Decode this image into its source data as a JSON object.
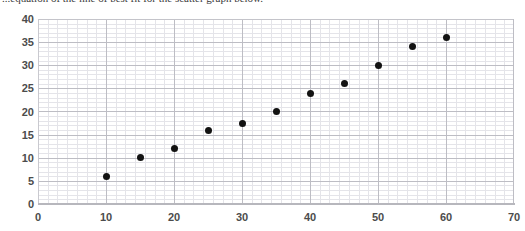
{
  "document": {
    "clipped_line": "...equation of the line of best fit for the scatter graph below."
  },
  "chart_data": {
    "type": "scatter",
    "title": "",
    "subtitle": "",
    "xlabel": "",
    "ylabel": "",
    "xlim": [
      0,
      70
    ],
    "ylim": [
      0,
      40
    ],
    "xticks": [
      0,
      10,
      20,
      30,
      40,
      50,
      60,
      70
    ],
    "yticks": [
      0,
      5,
      10,
      15,
      20,
      25,
      30,
      35,
      40
    ],
    "xtick_labels": [
      "0",
      "10",
      "20",
      "30",
      "40",
      "50",
      "60",
      "70"
    ],
    "ytick_labels": [
      "0",
      "5",
      "10",
      "15",
      "20",
      "25",
      "30",
      "35",
      "40"
    ],
    "x_major_step": 10,
    "y_major_step": 5,
    "grid": true,
    "minor_grid": true,
    "legend": false,
    "legend_position": "none",
    "marker": "circle",
    "marker_color": "#121212",
    "marker_size": 7,
    "grid_color_major": "#bdbdc4",
    "grid_color_minor": "#e4e4e9",
    "axis_color": "#b7b7bd",
    "tick_label_color": "#4c4c4c",
    "background": "#ffffff",
    "x": [
      10,
      15,
      20,
      25,
      30,
      35,
      40,
      45,
      50,
      55,
      60
    ],
    "y": [
      6,
      10,
      12,
      16,
      17.5,
      20,
      24,
      26,
      30,
      34,
      36
    ],
    "points": [
      {
        "x": 10,
        "y": 6
      },
      {
        "x": 15,
        "y": 10
      },
      {
        "x": 20,
        "y": 12
      },
      {
        "x": 25,
        "y": 16
      },
      {
        "x": 30,
        "y": 17.5
      },
      {
        "x": 35,
        "y": 20
      },
      {
        "x": 40,
        "y": 24
      },
      {
        "x": 45,
        "y": 26
      },
      {
        "x": 50,
        "y": 30
      },
      {
        "x": 55,
        "y": 34
      },
      {
        "x": 60,
        "y": 36
      }
    ]
  }
}
